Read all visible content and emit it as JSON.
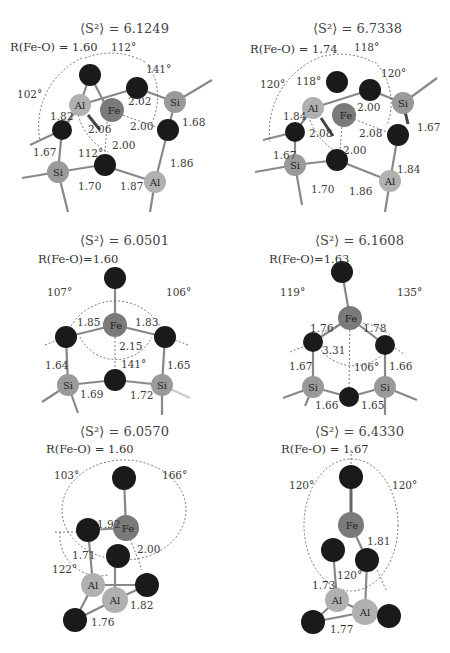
{
  "figure": {
    "element_colors": {
      "O": "#1a1a1a",
      "Fe": "#7a7a7a",
      "Si": "#9a9a9a",
      "Al": "#b0b0b0"
    },
    "panels": [
      {
        "id": "a",
        "s2_label": "⟨S²⟩ = 6.1249",
        "r_label": "R(Fe-O) = 1.60",
        "bonds": [
          "1.82",
          "2.06",
          "2.02",
          "2.00",
          "2.00",
          "1.68",
          "1.67",
          "1.70",
          "1.87",
          "1.86"
        ],
        "angles": [
          "112°",
          "141°",
          "102°",
          "112°"
        ],
        "atoms": [
          "Al",
          "Fe",
          "Si",
          "Si",
          "Al"
        ]
      },
      {
        "id": "b",
        "s2_label": "⟨S²⟩ = 6.7338",
        "r_label": "R(Fe-O) = 1.74",
        "bonds": [
          "1.84",
          "2.08",
          "2.00",
          "2.08",
          "1.67",
          "2.00",
          "1.67",
          "1.70",
          "1.86",
          "1.84"
        ],
        "angles": [
          "118°",
          "120°",
          "120°",
          "118°"
        ],
        "atoms": [
          "Al",
          "Fe",
          "Si",
          "Si",
          "Al"
        ]
      },
      {
        "id": "c",
        "s2_label": "⟨S²⟩ = 6.0501",
        "r_label": "R(Fe-O)=1.60",
        "bonds": [
          "1.85",
          "1.83",
          "2.15",
          "1.64",
          "1.65",
          "1.69",
          "1.72"
        ],
        "angles": [
          "107°",
          "106°",
          "141°"
        ],
        "atoms": [
          "Fe",
          "Si",
          "Si"
        ]
      },
      {
        "id": "d",
        "s2_label": "⟨S²⟩ = 6.1608",
        "r_label": "R(Fe-O)=1.63",
        "bonds": [
          "1.76",
          "1.78",
          "3.31",
          "1.67",
          "1.66",
          "1.66",
          "1.65"
        ],
        "angles": [
          "119°",
          "135°",
          "106°"
        ],
        "atoms": [
          "Fe",
          "Si",
          "Si"
        ]
      },
      {
        "id": "e",
        "s2_label": "⟨S²⟩ = 6.0570",
        "r_label": "R(Fe-O) = 1.60",
        "bonds": [
          "1.92",
          "1.71",
          "2.00",
          "1.82",
          "1.76"
        ],
        "angles": [
          "103°",
          "166°",
          "122°"
        ],
        "atoms": [
          "Fe",
          "Al",
          "Al"
        ]
      },
      {
        "id": "f",
        "s2_label": "⟨S²⟩ = 6.4330",
        "r_label": "R(Fe-O) = 1.67",
        "bonds": [
          "1.81",
          "1.73",
          "1.77"
        ],
        "angles": [
          "120°",
          "120°",
          "120°"
        ],
        "atoms": [
          "Fe",
          "Al",
          "Al"
        ]
      }
    ]
  }
}
